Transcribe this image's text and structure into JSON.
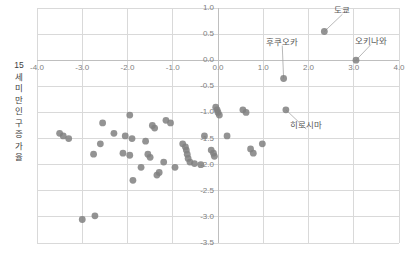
{
  "chart_data": {
    "type": "scatter",
    "title": "",
    "xlabel": "",
    "ylabel": "15 세 미만 인구 증가율",
    "ylabel_chars": [
      "15",
      "세",
      "미",
      "만",
      "인",
      "구",
      "증",
      "가",
      "율"
    ],
    "xlim": [
      -4.0,
      4.0
    ],
    "ylim": [
      -3.5,
      1.0
    ],
    "xticks": [
      -4.0,
      -3.0,
      -2.0,
      -1.0,
      0.0,
      1.0,
      2.0,
      3.0,
      4.0
    ],
    "xtick_labels": [
      "-4.0",
      "-3.0",
      "-2.0",
      "-1.0",
      "0.0",
      "1.0",
      "2.0",
      "3.0",
      "4.0"
    ],
    "yticks": [
      1.0,
      0.5,
      0.0,
      -0.5,
      -1.0,
      -1.5,
      -2.0,
      -2.5,
      -3.0,
      -3.5
    ],
    "ytick_labels": [
      "1.0",
      "0.5",
      "0.0",
      "-0.5",
      "-1.0",
      "-1.5",
      "-2.0",
      "-2.5",
      "-3.0",
      "-3.5"
    ],
    "grid": true,
    "legend": null,
    "marker_color": "#808080",
    "grid_color": "#d9d9d9",
    "axis_label_color": "#808080",
    "points": [
      [
        2.35,
        0.55
      ],
      [
        3.05,
        0.0
      ],
      [
        1.45,
        -0.35
      ],
      [
        1.5,
        -0.95
      ],
      [
        -0.05,
        -0.9
      ],
      [
        -0.02,
        -0.95
      ],
      [
        0.0,
        -1.0
      ],
      [
        0.03,
        -1.05
      ],
      [
        0.55,
        -0.95
      ],
      [
        0.62,
        -1.0
      ],
      [
        -1.95,
        -1.05
      ],
      [
        -1.15,
        -1.15
      ],
      [
        -1.05,
        -1.2
      ],
      [
        -1.45,
        -1.25
      ],
      [
        -1.4,
        -1.3
      ],
      [
        -2.55,
        -1.2
      ],
      [
        -2.3,
        -1.4
      ],
      [
        -3.5,
        -1.4
      ],
      [
        -3.42,
        -1.45
      ],
      [
        -0.3,
        -1.45
      ],
      [
        0.2,
        -1.45
      ],
      [
        -2.05,
        -1.45
      ],
      [
        -1.9,
        -1.5
      ],
      [
        -3.3,
        -1.5
      ],
      [
        -1.6,
        -1.55
      ],
      [
        -2.6,
        -1.6
      ],
      [
        -0.78,
        -1.6
      ],
      [
        -0.72,
        -1.66
      ],
      [
        -0.7,
        -1.72
      ],
      [
        -0.68,
        -1.8
      ],
      [
        -0.66,
        -1.88
      ],
      [
        -0.62,
        -1.95
      ],
      [
        -0.15,
        -1.72
      ],
      [
        -0.1,
        -1.78
      ],
      [
        -0.08,
        -1.84
      ],
      [
        0.72,
        -1.7
      ],
      [
        0.78,
        -1.78
      ],
      [
        -2.1,
        -1.78
      ],
      [
        -1.95,
        -1.82
      ],
      [
        -1.55,
        -1.8
      ],
      [
        -1.5,
        -1.86
      ],
      [
        -2.75,
        -1.8
      ],
      [
        -1.2,
        -1.95
      ],
      [
        -1.7,
        -2.05
      ],
      [
        -0.95,
        -2.05
      ],
      [
        -0.52,
        -1.98
      ],
      [
        -0.38,
        -2.0
      ],
      [
        -1.3,
        -2.15
      ],
      [
        -1.35,
        -2.2
      ],
      [
        0.98,
        -1.6
      ],
      [
        -1.88,
        -2.3
      ],
      [
        -3.0,
        -3.05
      ],
      [
        -2.72,
        -2.98
      ]
    ],
    "annotations": [
      {
        "label": "도쿄",
        "point": [
          2.35,
          0.55
        ],
        "label_pos": [
          2.75,
          0.88
        ]
      },
      {
        "label": "오키나와",
        "point": [
          3.05,
          0.0
        ],
        "label_pos": [
          3.38,
          0.3
        ]
      },
      {
        "label": "후쿠오카",
        "point": [
          1.45,
          -0.35
        ],
        "label_pos": [
          1.42,
          0.28
        ]
      },
      {
        "label": "히로시마",
        "point": [
          1.5,
          -0.95
        ],
        "label_pos": [
          1.95,
          -1.32
        ]
      }
    ]
  }
}
